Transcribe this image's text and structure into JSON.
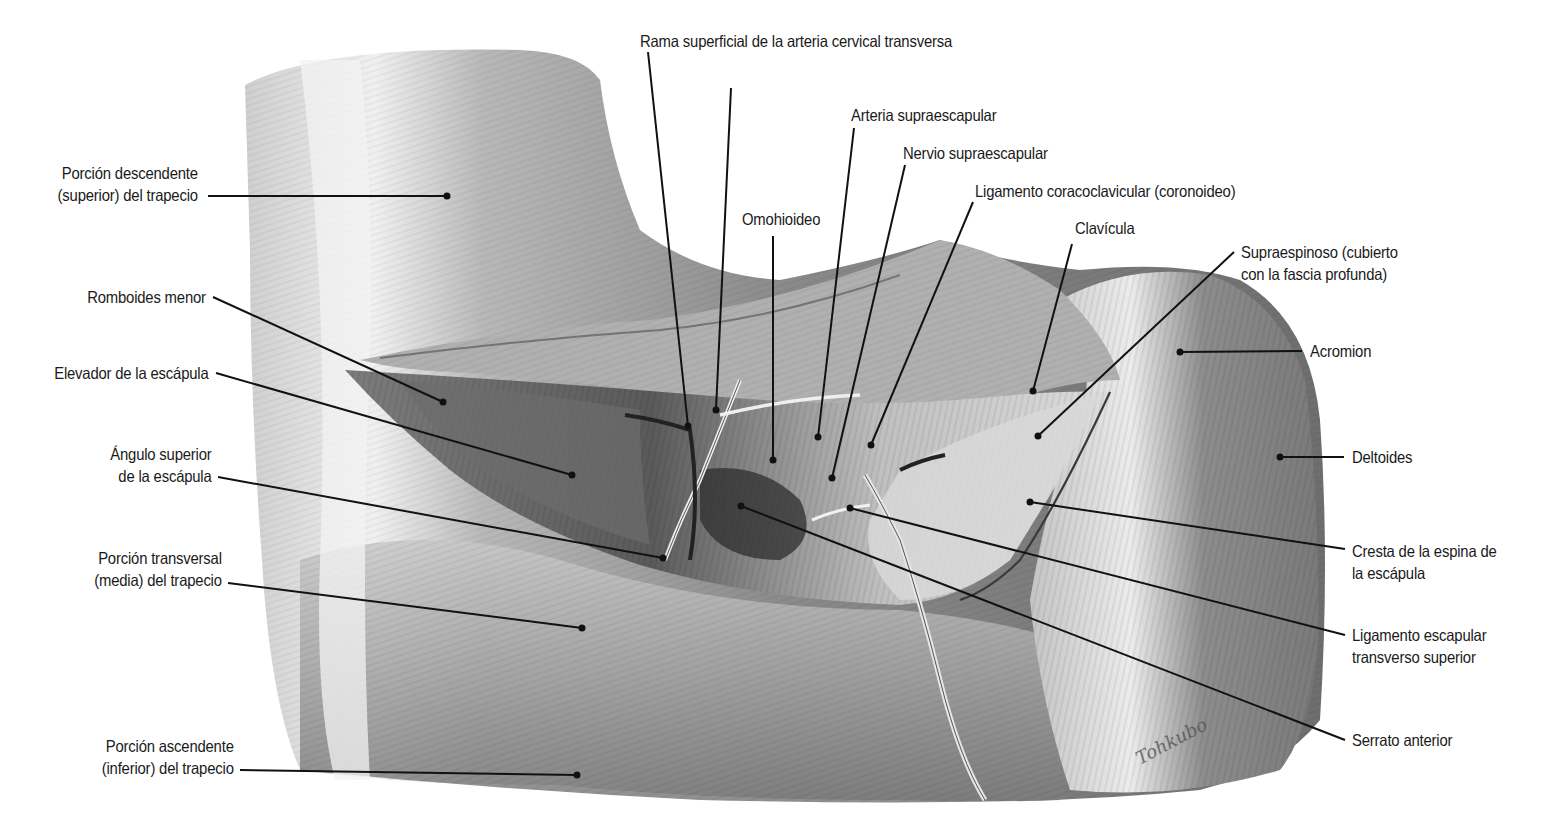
{
  "figure": {
    "type": "anatomical-illustration",
    "palette": {
      "background": "#ffffff",
      "muscle_light": "#d6d6d6",
      "muscle_mid": "#9a9a9a",
      "muscle_dark": "#4a4a4a",
      "line": "#111111"
    },
    "signature": "Tohkubo"
  },
  "labels": {
    "porcion_descendente": {
      "line1": "Porción descendente",
      "line2": "(superior) del trapecio"
    },
    "romboides_menor": {
      "line1": "Romboides menor"
    },
    "elevador": {
      "line1": "Elevador de la escápula"
    },
    "angulo_superior": {
      "line1": "Ángulo superior",
      "line2": "de la escápula"
    },
    "porcion_transversal": {
      "line1": "Porción transversal",
      "line2": "(media) del trapecio"
    },
    "porcion_ascendente": {
      "line1": "Porción ascendente",
      "line2": "(inferior) del trapecio"
    },
    "rama_superficial": {
      "line1": "Rama superficial de la arteria cervical transversa"
    },
    "arteria_supraescapular": {
      "line1": "Arteria supraescapular"
    },
    "nervio_supraescapular": {
      "line1": "Nervio supraescapular"
    },
    "ligamento_coracoclavicular": {
      "line1": "Ligamento coracoclavicular (coronoideo)"
    },
    "omohioideo": {
      "line1": "Omohioideo"
    },
    "clavicula": {
      "line1": "Clavícula"
    },
    "supraespinoso": {
      "line1": "Supraespinoso (cubierto",
      "line2": "con la fascia profunda)"
    },
    "acromion": {
      "line1": "Acromion"
    },
    "deltoides": {
      "line1": "Deltoides"
    },
    "cresta_espina": {
      "line1": "Cresta de la espina de",
      "line2": "la escápula"
    },
    "ligamento_escapular": {
      "line1": "Ligamento escapular",
      "line2": "transverso superior"
    },
    "serrato_anterior": {
      "line1": "Serrato anterior"
    }
  }
}
